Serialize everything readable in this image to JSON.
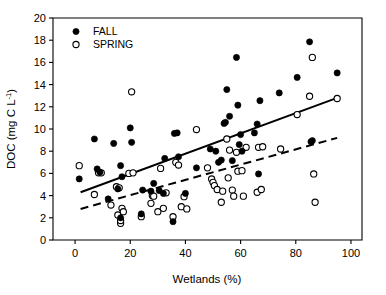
{
  "chart_data": {
    "type": "scatter",
    "title": "",
    "xlabel": "Wetlands (%)",
    "ylabel": "DOC (mg C L-1)",
    "ylabel_base": "DOC (mg C L",
    "ylabel_sup": "-1",
    "ylabel_tail": ")",
    "xlim": [
      -8,
      104
    ],
    "ylim": [
      0,
      20
    ],
    "xticks": [
      0,
      20,
      40,
      60,
      80,
      100
    ],
    "yticks": [
      0,
      2,
      4,
      6,
      8,
      10,
      12,
      14,
      16,
      18,
      20
    ],
    "xtick_labels": [
      "0",
      "20",
      "40",
      "60",
      "80",
      "100"
    ],
    "ytick_labels": [
      "0",
      "2",
      "4",
      "6",
      "8",
      "10",
      "12",
      "14",
      "16",
      "18",
      "20"
    ],
    "grid": false,
    "legend_position": "top-left",
    "legend": [
      {
        "name": "FALL",
        "marker": "filled-circle",
        "color": "#000000"
      },
      {
        "name": "SPRING",
        "marker": "open-circle",
        "color": "#000000"
      }
    ],
    "series": [
      {
        "name": "FALL",
        "marker": "filled-circle",
        "points": [
          [
            1.5,
            5.5
          ],
          [
            7.0,
            9.1
          ],
          [
            8.0,
            6.4
          ],
          [
            9.0,
            6.1
          ],
          [
            12.0,
            3.7
          ],
          [
            14.0,
            8.7
          ],
          [
            15.5,
            4.6
          ],
          [
            16.5,
            6.7
          ],
          [
            16.5,
            2.0
          ],
          [
            17.0,
            5.7
          ],
          [
            20.0,
            10.1
          ],
          [
            20.5,
            8.8
          ],
          [
            24.0,
            2.35
          ],
          [
            24.5,
            4.5
          ],
          [
            27.5,
            4.4
          ],
          [
            28.5,
            5.1
          ],
          [
            30.5,
            4.45
          ],
          [
            32.0,
            4.2
          ],
          [
            32.5,
            7.35
          ],
          [
            35.5,
            1.65
          ],
          [
            36.0,
            9.6
          ],
          [
            37.0,
            9.65
          ],
          [
            37.5,
            7.5
          ],
          [
            40.0,
            4.2
          ],
          [
            44.0,
            6.5
          ],
          [
            49.0,
            8.2
          ],
          [
            51.0,
            8.0
          ],
          [
            52.0,
            7.0
          ],
          [
            53.0,
            7.2
          ],
          [
            54.0,
            10.5
          ],
          [
            54.5,
            10.6
          ],
          [
            55.0,
            13.55
          ],
          [
            56.0,
            11.15
          ],
          [
            57.0,
            7.15
          ],
          [
            58.5,
            16.45
          ],
          [
            59.0,
            12.15
          ],
          [
            59.5,
            8.6
          ],
          [
            60.0,
            9.5
          ],
          [
            60.5,
            8.0
          ],
          [
            65.0,
            9.65
          ],
          [
            66.0,
            10.45
          ],
          [
            66.5,
            5.95
          ],
          [
            67.0,
            12.55
          ],
          [
            74.0,
            13.25
          ],
          [
            80.5,
            14.65
          ],
          [
            85.0,
            17.85
          ],
          [
            85.5,
            8.85
          ],
          [
            86.0,
            8.95
          ],
          [
            95.0,
            15.05
          ]
        ]
      },
      {
        "name": "SPRING",
        "marker": "open-circle",
        "points": [
          [
            1.5,
            6.7
          ],
          [
            7.0,
            4.1
          ],
          [
            8.5,
            6.05
          ],
          [
            9.5,
            6.05
          ],
          [
            13.0,
            3.15
          ],
          [
            15.0,
            4.8
          ],
          [
            15.5,
            2.25
          ],
          [
            16.0,
            4.7
          ],
          [
            16.5,
            1.5
          ],
          [
            16.5,
            1.75
          ],
          [
            17.0,
            2.85
          ],
          [
            17.5,
            2.55
          ],
          [
            19.5,
            6.0
          ],
          [
            20.5,
            13.35
          ],
          [
            21.0,
            6.05
          ],
          [
            24.0,
            2.1
          ],
          [
            27.5,
            3.3
          ],
          [
            28.0,
            4.0
          ],
          [
            28.5,
            3.95
          ],
          [
            30.0,
            2.55
          ],
          [
            31.0,
            6.45
          ],
          [
            32.0,
            2.85
          ],
          [
            33.0,
            4.25
          ],
          [
            35.5,
            2.1
          ],
          [
            36.5,
            7.0
          ],
          [
            37.5,
            6.75
          ],
          [
            38.5,
            3.0
          ],
          [
            39.5,
            3.9
          ],
          [
            40.5,
            2.8
          ],
          [
            44.0,
            9.95
          ],
          [
            48.0,
            6.5
          ],
          [
            49.5,
            5.5
          ],
          [
            50.0,
            5.2
          ],
          [
            50.5,
            4.9
          ],
          [
            51.5,
            4.55
          ],
          [
            53.0,
            3.4
          ],
          [
            53.5,
            4.4
          ],
          [
            55.0,
            9.1
          ],
          [
            55.5,
            5.6
          ],
          [
            56.0,
            8.1
          ],
          [
            57.0,
            4.5
          ],
          [
            57.5,
            3.95
          ],
          [
            58.5,
            7.9
          ],
          [
            59.0,
            6.2
          ],
          [
            60.5,
            6.25
          ],
          [
            61.0,
            3.95
          ],
          [
            62.0,
            8.35
          ],
          [
            66.0,
            4.3
          ],
          [
            66.5,
            8.35
          ],
          [
            67.5,
            4.55
          ],
          [
            68.0,
            8.4
          ],
          [
            74.5,
            8.2
          ],
          [
            80.5,
            11.3
          ],
          [
            85.0,
            12.95
          ],
          [
            86.0,
            16.45
          ],
          [
            86.5,
            5.95
          ],
          [
            87.0,
            3.4
          ],
          [
            95.0,
            12.75
          ]
        ]
      }
    ],
    "fit_lines": [
      {
        "name": "FALL regression",
        "style": "solid",
        "x": [
          2,
          95
        ],
        "y": [
          4.3,
          12.8
        ]
      },
      {
        "name": "SPRING regression",
        "style": "dashed",
        "x": [
          2,
          95
        ],
        "y": [
          2.8,
          9.2
        ]
      }
    ]
  }
}
